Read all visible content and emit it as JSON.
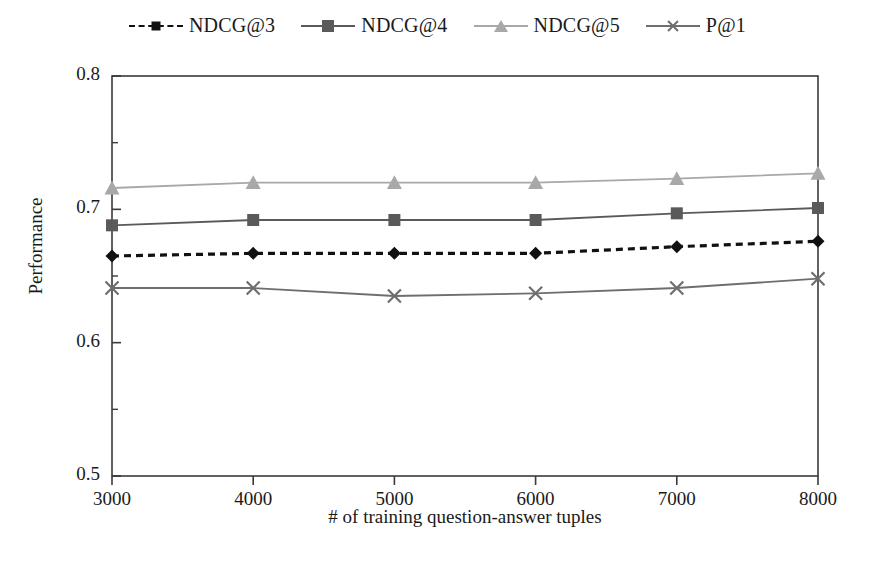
{
  "chart_data": {
    "type": "line",
    "title": "",
    "xlabel": "# of training question-answer tuples",
    "ylabel": "Performance",
    "x": [
      3000,
      4000,
      5000,
      6000,
      7000,
      8000
    ],
    "categories": [
      "3000",
      "4000",
      "5000",
      "6000",
      "7000",
      "8000"
    ],
    "xlim": [
      3000,
      8000
    ],
    "ylim": [
      0.5,
      0.8
    ],
    "xticks": [
      "3000",
      "4000",
      "5000",
      "6000",
      "7000",
      "8000"
    ],
    "yticks": [
      "0.5",
      "0.6",
      "0.7",
      "0.8"
    ],
    "yminorticks": [
      "0.55",
      "0.65",
      "0.75"
    ],
    "grid": false,
    "legend_position": "top-center",
    "series": [
      {
        "name": "NDCG@3",
        "values": [
          0.665,
          0.667,
          0.667,
          0.667,
          0.672,
          0.676
        ],
        "color": "#111111",
        "marker": "diamond",
        "linestyle": "dashed"
      },
      {
        "name": "NDCG@4",
        "values": [
          0.688,
          0.692,
          0.692,
          0.692,
          0.697,
          0.701
        ],
        "color": "#5a5a5a",
        "marker": "square",
        "linestyle": "solid"
      },
      {
        "name": "NDCG@5",
        "values": [
          0.716,
          0.72,
          0.72,
          0.72,
          0.723,
          0.727
        ],
        "color": "#a8a8a8",
        "marker": "triangle",
        "linestyle": "solid"
      },
      {
        "name": "P@1",
        "values": [
          0.641,
          0.641,
          0.635,
          0.637,
          0.641,
          0.648
        ],
        "color": "#6e6e6e",
        "marker": "cross",
        "linestyle": "solid"
      }
    ]
  },
  "legend": {
    "items": [
      {
        "label": "NDCG@3"
      },
      {
        "label": "NDCG@4"
      },
      {
        "label": "NDCG@5"
      },
      {
        "label": "P@1"
      }
    ]
  },
  "axes": {
    "y_title": "Performance",
    "x_title": "# of training question-answer tuples",
    "y_labels": [
      "0.8",
      "0.7",
      "0.6",
      "0.5"
    ],
    "x_labels": [
      "3000",
      "4000",
      "5000",
      "6000",
      "7000",
      "8000"
    ]
  }
}
